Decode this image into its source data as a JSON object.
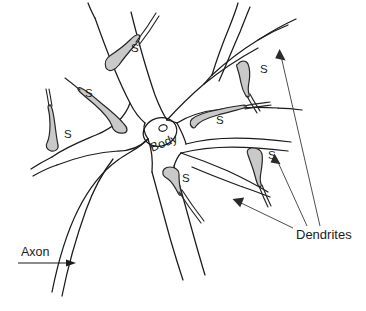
{
  "figure": {
    "background_color": "#ffffff",
    "line_color": "#1b1b1b",
    "bouton_fill_color": "#c9c9c9",
    "bouton_stroke_color": "#262626",
    "leader_color": "#3a3a3a"
  },
  "labels": {
    "body": "Body",
    "axon": "Axon",
    "dendrites": "Dendrites",
    "synapse_symbol": "S"
  },
  "synapses": [
    {
      "id": "synapse-top-left",
      "label": "S",
      "label_x": 131,
      "label_y": 52,
      "bouton_cx": 117,
      "bouton_cy": 60
    },
    {
      "id": "synapse-upper-left",
      "label": "S",
      "label_x": 85,
      "label_y": 97,
      "bouton_cx": 117,
      "bouton_cy": 127
    },
    {
      "id": "synapse-far-left",
      "label": "S",
      "label_x": 64,
      "label_y": 138,
      "bouton_cx": 55,
      "bouton_cy": 146
    },
    {
      "id": "synapse-upper-right",
      "label": "S",
      "label_x": 260,
      "label_y": 73,
      "bouton_cx": 245,
      "bouton_cy": 76
    },
    {
      "id": "synapse-mid-right",
      "label": "S",
      "label_x": 216,
      "label_y": 124,
      "bouton_cx": 201,
      "bouton_cy": 121
    },
    {
      "id": "synapse-lower-right",
      "label": "S",
      "label_x": 268,
      "label_y": 159,
      "bouton_cx": 253,
      "bouton_cy": 157
    },
    {
      "id": "synapse-bottom",
      "label": "S",
      "label_x": 182,
      "label_y": 182,
      "bouton_cx": 170,
      "bouton_cy": 176
    }
  ],
  "annotations": [
    {
      "id": "annotation-body",
      "text": "Body",
      "x": 152,
      "y": 152,
      "rotation_deg": -22
    },
    {
      "id": "annotation-axon",
      "text": "Axon",
      "x": 21,
      "y": 256,
      "rotation_deg": 0
    },
    {
      "id": "annotation-dendrites",
      "text": "Dendrites",
      "x": 296,
      "y": 239,
      "rotation_deg": 0
    }
  ],
  "counts": {
    "synapse_count": 7,
    "dendrite_leader_lines": 3
  }
}
